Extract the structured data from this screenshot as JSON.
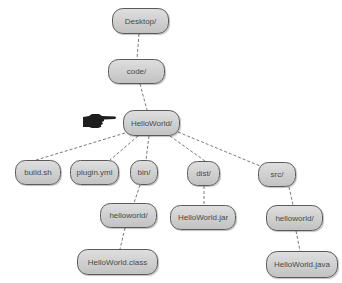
{
  "diagram": {
    "type": "directory-tree",
    "nodes": [
      {
        "id": "desktop",
        "label": "Desktop/",
        "x": 112,
        "y": 8,
        "w": 57,
        "h": 26
      },
      {
        "id": "code",
        "label": "code/",
        "x": 108,
        "y": 59,
        "w": 57,
        "h": 25
      },
      {
        "id": "helloworld-root",
        "label": "HelloWorld/",
        "x": 123,
        "y": 110,
        "w": 57,
        "h": 26
      },
      {
        "id": "build-sh",
        "label": "build.sh",
        "x": 15,
        "y": 160,
        "w": 46,
        "h": 25
      },
      {
        "id": "plugin-yml",
        "label": "plugin.yml",
        "x": 70,
        "y": 160,
        "w": 49,
        "h": 25
      },
      {
        "id": "bin",
        "label": "bin/",
        "x": 130,
        "y": 160,
        "w": 28,
        "h": 25
      },
      {
        "id": "dist",
        "label": "dist/",
        "x": 187,
        "y": 161,
        "w": 33,
        "h": 25
      },
      {
        "id": "src",
        "label": "src/",
        "x": 258,
        "y": 162,
        "w": 38,
        "h": 25
      },
      {
        "id": "bin-helloworld",
        "label": "helloworld/",
        "x": 100,
        "y": 203,
        "w": 57,
        "h": 25
      },
      {
        "id": "helloworld-jar",
        "label": "HelloWorld.jar",
        "x": 170,
        "y": 205,
        "w": 66,
        "h": 25
      },
      {
        "id": "src-helloworld",
        "label": "helloworld/",
        "x": 266,
        "y": 205,
        "w": 57,
        "h": 26
      },
      {
        "id": "helloworld-class",
        "label": "HelloWorld.class",
        "x": 77,
        "y": 249,
        "w": 81,
        "h": 26
      },
      {
        "id": "helloworld-java",
        "label": "HelloWorld.java",
        "x": 266,
        "y": 251,
        "w": 72,
        "h": 27
      }
    ],
    "edges": [
      {
        "from": "desktop",
        "to": "code",
        "x1": 139,
        "y1": 34,
        "x2": 137,
        "y2": 59
      },
      {
        "from": "code",
        "to": "helloworld-root",
        "x1": 140,
        "y1": 84,
        "x2": 147,
        "y2": 110
      },
      {
        "from": "helloworld-root",
        "to": "build-sh",
        "x1": 125,
        "y1": 133,
        "x2": 33,
        "y2": 161
      },
      {
        "from": "helloworld-root",
        "to": "plugin-yml",
        "x1": 138,
        "y1": 136,
        "x2": 110,
        "y2": 160
      },
      {
        "from": "helloworld-root",
        "to": "bin",
        "x1": 149,
        "y1": 136,
        "x2": 146,
        "y2": 160
      },
      {
        "from": "helloworld-root",
        "to": "dist",
        "x1": 170,
        "y1": 136,
        "x2": 205,
        "y2": 161
      },
      {
        "from": "helloworld-root",
        "to": "src",
        "x1": 178,
        "y1": 132,
        "x2": 260,
        "y2": 166
      },
      {
        "from": "bin",
        "to": "bin-helloworld",
        "x1": 140,
        "y1": 185,
        "x2": 134,
        "y2": 203
      },
      {
        "from": "dist",
        "to": "helloworld-jar",
        "x1": 204,
        "y1": 186,
        "x2": 204,
        "y2": 205
      },
      {
        "from": "src",
        "to": "src-helloworld",
        "x1": 289,
        "y1": 187,
        "x2": 293,
        "y2": 205
      },
      {
        "from": "bin-helloworld",
        "to": "helloworld-class",
        "x1": 125,
        "y1": 228,
        "x2": 120,
        "y2": 249
      },
      {
        "from": "src-helloworld",
        "to": "helloworld-java",
        "x1": 296,
        "y1": 231,
        "x2": 300,
        "y2": 251
      }
    ],
    "pointer": {
      "icon": "pointing-hand-icon",
      "target": "helloworld-root",
      "x": 83,
      "y": 113
    }
  },
  "colors": {
    "background": "#ffffff",
    "node_fill_top": "#dedede",
    "node_fill_bottom": "#c2c2c2",
    "node_border": "#5a5a5a",
    "node_text": "#4a4a4a",
    "edge": "#7a7a7a",
    "pointer": "#1e1e1e"
  }
}
